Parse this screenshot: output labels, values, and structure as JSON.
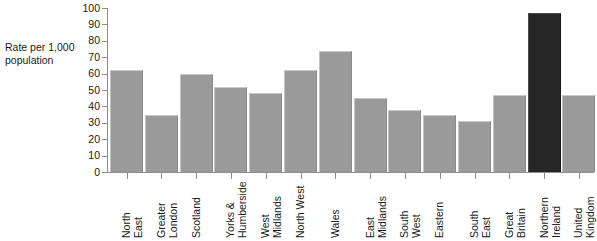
{
  "chart_data": {
    "type": "bar",
    "title": "",
    "subtitle": "",
    "xlabel": "",
    "ylabel": "Rate per 1,000\npopulation",
    "ylim": [
      0,
      100
    ],
    "ytick_step": 10,
    "yticks": [
      "100",
      "90",
      "80",
      "70",
      "60",
      "50",
      "40",
      "30",
      "20",
      "10",
      "0"
    ],
    "grid": false,
    "legend": "none",
    "categories": [
      "North\nEast",
      "Greater\nLondon",
      "Scotland",
      "Yorks &\nHumberside",
      "West\nMidlands",
      "North West",
      "Wales",
      "East\nMidlands",
      "South\nWest",
      "Eastern",
      "South\nEast",
      "Great\nBritain",
      "Northern\nIreland",
      "United\nKingdom"
    ],
    "values": [
      62,
      35,
      60,
      52,
      48,
      62,
      74,
      45,
      38,
      35,
      31,
      47,
      97,
      47
    ],
    "colors": [
      "#9a9a9a",
      "#9a9a9a",
      "#9a9a9a",
      "#9a9a9a",
      "#9a9a9a",
      "#9a9a9a",
      "#9a9a9a",
      "#9a9a9a",
      "#9a9a9a",
      "#9a9a9a",
      "#9a9a9a",
      "#9a9a9a",
      "#262626",
      "#9a9a9a"
    ],
    "highlight_category": "Northern\nIreland",
    "palette": {
      "bar_gray": "#9a9a9a",
      "bar_dark": "#262626",
      "axis": "#8d8d8d",
      "text": "#1a1a1a",
      "background": "#ffffff"
    }
  }
}
